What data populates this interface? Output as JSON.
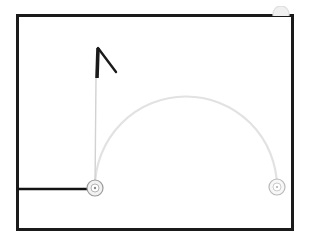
{
  "scene": {
    "title": "Pendulum Trajectory Diagram",
    "background_color": "#ffffff",
    "width": 310,
    "height": 245
  },
  "frame": {
    "label": "simulation-frame",
    "x": 16,
    "y": 14,
    "width": 278,
    "height": 217,
    "stroke_color": "#1a1a1a",
    "stroke_width": 3
  },
  "nodes": [
    {
      "id": "1",
      "label": "pivot-node",
      "cx": 95,
      "cy": 188,
      "r": 8,
      "stroke_color": "#9a9a9a",
      "fill_color": "#f2f2f2",
      "inner_r": 4,
      "inner_stroke_color": "#b4b4b4"
    },
    {
      "id": "2",
      "label": "end-node",
      "cx": 277,
      "cy": 187,
      "r": 8,
      "stroke_color": "#b9b9b9",
      "fill_color": "#f7f7f7",
      "inner_r": 4,
      "inner_stroke_color": "#cccccc"
    }
  ],
  "ghost_node": {
    "label": "clipped-ghost-node",
    "cx": 281,
    "cy": 14,
    "r": 8,
    "stroke_color": "#e0e0e0",
    "fill_color": "#f0f0f0"
  },
  "trajectory_arc": {
    "label": "trajectory-arc",
    "start_x": 95,
    "start_y": 188,
    "end_x": 277,
    "end_y": 187,
    "peak_x": 186,
    "peak_y": 97,
    "stroke_color": "#e2e2e2",
    "stroke_width": 2.2
  },
  "ground_line": {
    "label": "ground-line",
    "x1": 18,
    "y1": 189,
    "x2": 95,
    "y2": 189,
    "stroke_color": "#131313",
    "stroke_width": 2.6
  },
  "rod": {
    "label": "pendulum-rod",
    "x1": 95,
    "y1": 188,
    "x2": 96,
    "y2": 78,
    "stroke_color": "#d2d2d2",
    "stroke_width": 1.4
  },
  "vector_arrow": {
    "label": "velocity-vector",
    "shaft_x1": 97,
    "shaft_y1": 78,
    "shaft_x2": 98,
    "shaft_y2": 48,
    "head_x1": 98,
    "head_y1": 48,
    "head_x2": 116,
    "head_y2": 72,
    "stroke_color": "#1a1a1a",
    "shaft_width": 3.6,
    "head_width": 2.4
  }
}
